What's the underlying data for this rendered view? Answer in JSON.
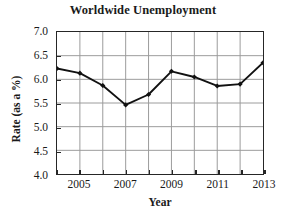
{
  "chart_data": {
    "type": "line",
    "title": "Worldwide Unemployment",
    "xlabel": "Year",
    "ylabel": "Rate (as a %)",
    "x": [
      2004,
      2005,
      2006,
      2007,
      2008,
      2009,
      2010,
      2011,
      2012,
      2013
    ],
    "values": [
      6.23,
      6.13,
      5.87,
      5.46,
      5.68,
      6.17,
      6.05,
      5.86,
      5.9,
      6.35
    ],
    "series": [
      {
        "name": "Unemployment rate",
        "values": [
          6.23,
          6.13,
          5.87,
          5.46,
          5.68,
          6.17,
          6.05,
          5.86,
          5.9,
          6.35
        ]
      }
    ],
    "xlim": [
      2004,
      2013
    ],
    "ylim": [
      4.0,
      7.0
    ],
    "ytick_labels": [
      "7.0",
      "6.5",
      "6.0",
      "5.5",
      "5.0",
      "4.5",
      "4.0"
    ],
    "ytick_values": [
      7.0,
      6.5,
      6.0,
      5.5,
      5.0,
      4.5,
      4.0
    ],
    "xtick_labels": [
      "2005",
      "2007",
      "2009",
      "2011",
      "2013"
    ],
    "xtick_values": [
      2005,
      2007,
      2009,
      2011,
      2013
    ],
    "xtick_minor_values": [
      2004,
      2006,
      2008,
      2010,
      2012
    ],
    "grid": true,
    "grid_color": "#9a9a9a",
    "line_color": "#111111",
    "marker": "diamond",
    "marker_color": "#111111",
    "legend": null,
    "legend_position": "none",
    "annotations": []
  }
}
